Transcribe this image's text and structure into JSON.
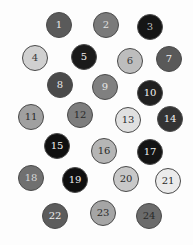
{
  "diagram": {
    "type": "numbered-circles",
    "circle_radius": 13,
    "circles": [
      {
        "label": "1",
        "x": 59,
        "y": 25,
        "fill": "#5a5a5a",
        "text": "#e8e8e8"
      },
      {
        "label": "2",
        "x": 106,
        "y": 25,
        "fill": "#7a7a7a",
        "text": "#e0e0e0"
      },
      {
        "label": "3",
        "x": 150,
        "y": 27,
        "fill": "#151515",
        "text": "#bdbdbd"
      },
      {
        "label": "4",
        "x": 35,
        "y": 58,
        "fill": "#d0d0d0",
        "text": "#3a3a3a"
      },
      {
        "label": "5",
        "x": 84,
        "y": 57,
        "fill": "#1a1a1a",
        "text": "#f0f0f0"
      },
      {
        "label": "6",
        "x": 130,
        "y": 61,
        "fill": "#bdbdbd",
        "text": "#3a3a3a"
      },
      {
        "label": "7",
        "x": 169,
        "y": 59,
        "fill": "#595959",
        "text": "#f0f0f0"
      },
      {
        "label": "8",
        "x": 60,
        "y": 85,
        "fill": "#4a4a4a",
        "text": "#e8e8e8"
      },
      {
        "label": "9",
        "x": 105,
        "y": 87,
        "fill": "#808080",
        "text": "#e6e6e6"
      },
      {
        "label": "10",
        "x": 150,
        "y": 93,
        "fill": "#202020",
        "text": "#f0f0f0"
      },
      {
        "label": "11",
        "x": 31,
        "y": 117,
        "fill": "#a0a0a0",
        "text": "#2a2a2a"
      },
      {
        "label": "12",
        "x": 80,
        "y": 115,
        "fill": "#7d7d7d",
        "text": "#2a2a2a"
      },
      {
        "label": "13",
        "x": 128,
        "y": 120,
        "fill": "#e0e0e0",
        "text": "#2a2a2a"
      },
      {
        "label": "14",
        "x": 170,
        "y": 119,
        "fill": "#333333",
        "text": "#f0f0f0"
      },
      {
        "label": "15",
        "x": 57,
        "y": 146,
        "fill": "#101010",
        "text": "#f0f0f0"
      },
      {
        "label": "16",
        "x": 104,
        "y": 151,
        "fill": "#b5b5b5",
        "text": "#2a2a2a"
      },
      {
        "label": "17",
        "x": 150,
        "y": 152,
        "fill": "#141414",
        "text": "#f0f0f0"
      },
      {
        "label": "18",
        "x": 31,
        "y": 178,
        "fill": "#707070",
        "text": "#d8d8d8"
      },
      {
        "label": "19",
        "x": 75,
        "y": 180,
        "fill": "#0f0f0f",
        "text": "#f0f0f0"
      },
      {
        "label": "20",
        "x": 126,
        "y": 179,
        "fill": "#c8c8c8",
        "text": "#2a2a2a"
      },
      {
        "label": "21",
        "x": 168,
        "y": 181,
        "fill": "#ebebeb",
        "text": "#2a2a2a"
      },
      {
        "label": "22",
        "x": 55,
        "y": 216,
        "fill": "#5c5c5c",
        "text": "#f0f0f0"
      },
      {
        "label": "23",
        "x": 103,
        "y": 213,
        "fill": "#a5a5a5",
        "text": "#2a2a2a"
      },
      {
        "label": "24",
        "x": 149,
        "y": 216,
        "fill": "#6b6b6b",
        "text": "#2a2a2a"
      }
    ]
  }
}
